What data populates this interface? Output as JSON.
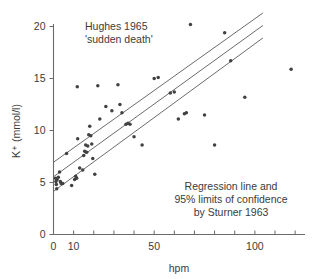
{
  "chart_data": {
    "type": "scatter",
    "title": "Hughes 1965",
    "subtitle": "'sudden death'",
    "xlabel": "hpm",
    "ylabel": "K⁺ (mmol/l)",
    "xlim": [
      0,
      125
    ],
    "ylim": [
      0,
      21
    ],
    "grid": false,
    "legend_position": "none",
    "x_tick_labels": [
      "0",
      "10",
      "50",
      "100"
    ],
    "x_tick_values": [
      0,
      10,
      50,
      100
    ],
    "x_minor_tick_count": 12,
    "y_tick_labels": [
      "0",
      "5",
      "10",
      "15",
      "20"
    ],
    "y_tick_values": [
      0,
      5,
      10,
      15,
      20
    ],
    "annotations": [
      {
        "text": "Hughes 1965",
        "x": 20,
        "y": 20.0
      },
      {
        "text": "'sudden death'",
        "x": 20,
        "y": 19.0
      },
      {
        "text": "Regression line and",
        "x": 66,
        "y": 4.4
      },
      {
        "text": "95% limits of confidence",
        "x": 66,
        "y": 3.5
      },
      {
        "text": "by Sturner 1963",
        "x": 66,
        "y": 2.6
      }
    ],
    "series": [
      {
        "name": "K+ vs hpm",
        "marker": "circle",
        "color": "#414141",
        "points": [
          [
            1.0,
            5.4
          ],
          [
            1.2,
            5.1
          ],
          [
            1.4,
            4.8
          ],
          [
            1.6,
            4.4
          ],
          [
            1.8,
            5.3
          ],
          [
            2.4,
            5.5
          ],
          [
            3.0,
            6.0
          ],
          [
            3.4,
            5.1
          ],
          [
            3.8,
            4.9
          ],
          [
            4.6,
            4.9
          ],
          [
            6.5,
            7.8
          ],
          [
            9.0,
            4.7
          ],
          [
            10.5,
            5.3
          ],
          [
            11.0,
            5.6
          ],
          [
            11.5,
            5.4
          ],
          [
            11.8,
            14.2
          ],
          [
            12.0,
            9.2
          ],
          [
            13.0,
            6.4
          ],
          [
            14.5,
            6.2
          ],
          [
            15.0,
            7.6
          ],
          [
            15.5,
            8.0
          ],
          [
            16.0,
            8.6
          ],
          [
            16.5,
            7.9
          ],
          [
            17.0,
            8.5
          ],
          [
            17.5,
            9.6
          ],
          [
            18.0,
            10.4
          ],
          [
            18.5,
            9.5
          ],
          [
            19.0,
            8.7
          ],
          [
            19.5,
            7.3
          ],
          [
            20.5,
            5.8
          ],
          [
            22.0,
            14.3
          ],
          [
            23.0,
            11.1
          ],
          [
            26.0,
            12.3
          ],
          [
            29.0,
            11.9
          ],
          [
            32.0,
            14.4
          ],
          [
            33.0,
            12.5
          ],
          [
            34.0,
            11.7
          ],
          [
            36.0,
            10.6
          ],
          [
            37.0,
            10.7
          ],
          [
            38.0,
            10.6
          ],
          [
            40.0,
            9.4
          ],
          [
            44.0,
            8.6
          ],
          [
            50.0,
            15.0
          ],
          [
            52.0,
            15.1
          ],
          [
            58.0,
            13.6
          ],
          [
            60.0,
            13.7
          ],
          [
            62.0,
            11.1
          ],
          [
            65.0,
            11.6
          ],
          [
            66.0,
            11.7
          ],
          [
            68.0,
            20.2
          ],
          [
            75.0,
            11.5
          ],
          [
            80.0,
            8.6
          ],
          [
            85.0,
            19.4
          ],
          [
            88.0,
            16.7
          ],
          [
            95.0,
            13.2
          ],
          [
            118.0,
            15.9
          ]
        ]
      }
    ],
    "lines": [
      {
        "name": "upper 95% confidence limit",
        "style": "solid",
        "color": "#5a5a5a",
        "x_start": 0,
        "y_start": 6.95,
        "x_end": 104,
        "y_end": 21.3
      },
      {
        "name": "regression line",
        "style": "solid",
        "color": "#5a5a5a",
        "x_start": 0,
        "y_start": 5.55,
        "x_end": 104,
        "y_end": 20.1
      },
      {
        "name": "lower 95% confidence limit",
        "style": "solid",
        "color": "#5a5a5a",
        "x_start": 0,
        "y_start": 4.15,
        "x_end": 104,
        "y_end": 18.9
      }
    ]
  },
  "figure": {
    "background_color": "#ffffff",
    "text_color": "#3b3b3b",
    "axis_color": "#6a6a6a",
    "marker_color": "#414141",
    "line_color": "#5a5a5a"
  }
}
